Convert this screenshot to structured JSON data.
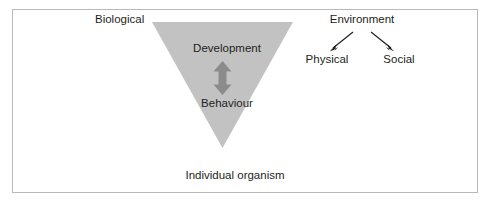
{
  "figure": {
    "name": "biological-environment-individual-organism-diagram",
    "background_color": "#ffffff",
    "frame_border_color": "#b9b9bb",
    "triangle": {
      "shape": "inverted-triangle",
      "fill_color": "#c2c2c2",
      "label_top": "Development",
      "label_bottom": "Behaviour",
      "arrow_color": "#8b8b8b",
      "arrow_kind": "double-headed-vertical"
    },
    "labels": {
      "biological": "Biological",
      "development": "Development",
      "behaviour": "Behaviour",
      "individual_organism": "Individual organism",
      "environment": "Environment",
      "physical": "Physical",
      "social": "Social"
    },
    "connectors": {
      "environment_to_physical": "arrow-down-left",
      "environment_to_social": "arrow-down-right",
      "development_behaviour": "double-arrow-vertical",
      "arrow_stroke_color": "#231f20"
    },
    "text_color": "#231f20"
  }
}
